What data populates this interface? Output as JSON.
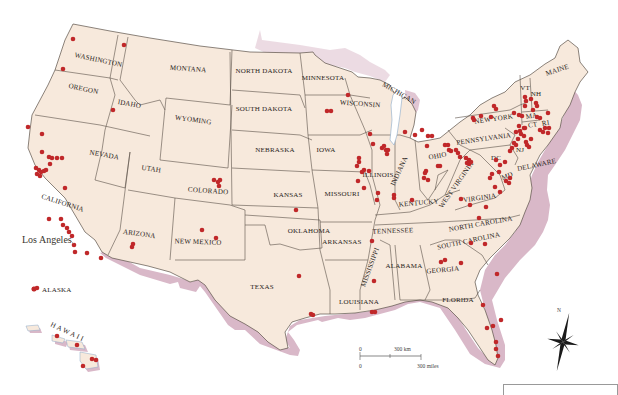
{
  "map": {
    "title": "United States point locations map",
    "background_color": "#ffffff",
    "land_color": "#f7e9dc",
    "border_color": "#5a5048",
    "coast_shadow_color": "#d9b8c8",
    "marker_color": "#c0282a",
    "states": [
      {
        "name": "WASHINGTON",
        "x": 98,
        "y": 62,
        "rot": 12
      },
      {
        "name": "OREGON",
        "x": 83,
        "y": 91,
        "rot": 12
      },
      {
        "name": "IDAHO",
        "x": 129,
        "y": 106,
        "rot": 10
      },
      {
        "name": "MONTANA",
        "x": 188,
        "y": 71,
        "rot": 4
      },
      {
        "name": "WYOMING",
        "x": 193,
        "y": 122,
        "rot": 8
      },
      {
        "name": "NEVADA",
        "x": 104,
        "y": 157,
        "rot": 10
      },
      {
        "name": "UTAH",
        "x": 151,
        "y": 171,
        "rot": 8
      },
      {
        "name": "COLORADO",
        "x": 208,
        "y": 193,
        "rot": 4
      },
      {
        "name": "CALIFORNIA",
        "x": 62,
        "y": 205,
        "rot": 18
      },
      {
        "name": "ARIZONA",
        "x": 139,
        "y": 236,
        "rot": 8
      },
      {
        "name": "NEW MEXICO",
        "x": 198,
        "y": 244,
        "rot": 2
      },
      {
        "name": "NORTH DAKOTA",
        "x": 264,
        "y": 73,
        "rot": 0
      },
      {
        "name": "SOUTH DAKOTA",
        "x": 264,
        "y": 111,
        "rot": 0
      },
      {
        "name": "NEBRASKA",
        "x": 275,
        "y": 152,
        "rot": 0
      },
      {
        "name": "KANSAS",
        "x": 288,
        "y": 197,
        "rot": 0
      },
      {
        "name": "OKLAHOMA",
        "x": 309,
        "y": 233,
        "rot": 0
      },
      {
        "name": "TEXAS",
        "x": 262,
        "y": 289,
        "rot": 0
      },
      {
        "name": "MINNESOTA",
        "x": 323,
        "y": 80,
        "rot": 0
      },
      {
        "name": "IOWA",
        "x": 326,
        "y": 152,
        "rot": 0
      },
      {
        "name": "MISSOURI",
        "x": 342,
        "y": 196,
        "rot": 0
      },
      {
        "name": "ARKANSAS",
        "x": 342,
        "y": 244,
        "rot": 0
      },
      {
        "name": "LOUISIANA",
        "x": 359,
        "y": 304,
        "rot": 0
      },
      {
        "name": "WISCONSIN",
        "x": 360,
        "y": 106,
        "rot": 4
      },
      {
        "name": "MICHIGAN",
        "x": 398,
        "y": 95,
        "rot": 30
      },
      {
        "name": "ILLINOIS",
        "x": 378,
        "y": 177,
        "rot": 0
      },
      {
        "name": "INDIANA",
        "x": 401,
        "y": 172,
        "rot": -65
      },
      {
        "name": "OHIO",
        "x": 438,
        "y": 158,
        "rot": -10
      },
      {
        "name": "KENTUCKY",
        "x": 419,
        "y": 205,
        "rot": -5
      },
      {
        "name": "TENNESSEE",
        "x": 393,
        "y": 233,
        "rot": -2
      },
      {
        "name": "MISSISSIPPI",
        "x": 372,
        "y": 268,
        "rot": -70
      },
      {
        "name": "ALABAMA",
        "x": 404,
        "y": 268,
        "rot": 0
      },
      {
        "name": "GEORGIA",
        "x": 443,
        "y": 272,
        "rot": -5
      },
      {
        "name": "FLORIDA",
        "x": 458,
        "y": 302,
        "rot": 0
      },
      {
        "name": "SOUTH CAROLINA",
        "x": 469,
        "y": 243,
        "rot": -12
      },
      {
        "name": "NORTH CAROLINA",
        "x": 481,
        "y": 226,
        "rot": -10
      },
      {
        "name": "VIRGINIA",
        "x": 480,
        "y": 200,
        "rot": -8
      },
      {
        "name": "WEST VIRGINIA",
        "x": 458,
        "y": 186,
        "rot": -55
      },
      {
        "name": "PENNSYLVANIA",
        "x": 484,
        "y": 141,
        "rot": -8
      },
      {
        "name": "NEW YORK",
        "x": 494,
        "y": 121,
        "rot": -8
      },
      {
        "name": "VT",
        "x": 525,
        "y": 90,
        "rot": 0
      },
      {
        "name": "NH",
        "x": 536,
        "y": 96,
        "rot": 0
      },
      {
        "name": "MAINE",
        "x": 558,
        "y": 72,
        "rot": -18
      },
      {
        "name": "MA",
        "x": 532,
        "y": 118,
        "rot": -10
      },
      {
        "name": "CT",
        "x": 533,
        "y": 127,
        "rot": -10
      },
      {
        "name": "RI",
        "x": 546,
        "y": 125,
        "rot": -10
      },
      {
        "name": "NJ",
        "x": 520,
        "y": 152,
        "rot": 0
      },
      {
        "name": "DC",
        "x": 496,
        "y": 160,
        "rot": 0
      },
      {
        "name": "MD",
        "x": 508,
        "y": 178,
        "rot": -20
      },
      {
        "name": "DELAWARE",
        "x": 537,
        "y": 167,
        "rot": -12
      }
    ],
    "callouts": {
      "los_angeles": "Los Angeles",
      "alaska": "ALASKA",
      "hawaii": "H A W A I I"
    },
    "scale_bar": {
      "km_zero": "0",
      "km_label": "300 km",
      "mi_zero": "0",
      "mi_label": "300 miles"
    },
    "compass": {
      "north_label": "N"
    }
  },
  "markers": [
    [
      73,
      39
    ],
    [
      124,
      45
    ],
    [
      63,
      69
    ],
    [
      113,
      110
    ],
    [
      28,
      127
    ],
    [
      42,
      134
    ],
    [
      42,
      152
    ],
    [
      49,
      157
    ],
    [
      52,
      158
    ],
    [
      57,
      158
    ],
    [
      62,
      158
    ],
    [
      50,
      164
    ],
    [
      36,
      168
    ],
    [
      39,
      170
    ],
    [
      41,
      172
    ],
    [
      44,
      171
    ],
    [
      37,
      174
    ],
    [
      46,
      170
    ],
    [
      40,
      176
    ],
    [
      65,
      188
    ],
    [
      214,
      180
    ],
    [
      220,
      180
    ],
    [
      218,
      182
    ],
    [
      219,
      186
    ],
    [
      49,
      219
    ],
    [
      61,
      219
    ],
    [
      63,
      225
    ],
    [
      67,
      228
    ],
    [
      69,
      232
    ],
    [
      72,
      236
    ],
    [
      74,
      245
    ],
    [
      75,
      252
    ],
    [
      87,
      253
    ],
    [
      101,
      258
    ],
    [
      133,
      244
    ],
    [
      132,
      247
    ],
    [
      202,
      230
    ],
    [
      216,
      238
    ],
    [
      34,
      289
    ],
    [
      37,
      288
    ],
    [
      57,
      336
    ],
    [
      77,
      345
    ],
    [
      92,
      359
    ],
    [
      83,
      366
    ],
    [
      96,
      360
    ],
    [
      296,
      210
    ],
    [
      299,
      276
    ],
    [
      311,
      314
    ],
    [
      313,
      315
    ],
    [
      372,
      241
    ],
    [
      374,
      281
    ],
    [
      372,
      312
    ],
    [
      375,
      312
    ],
    [
      327,
      111
    ],
    [
      331,
      111
    ],
    [
      348,
      95
    ],
    [
      370,
      134
    ],
    [
      373,
      144
    ],
    [
      382,
      148
    ],
    [
      384,
      146
    ],
    [
      386,
      150
    ],
    [
      388,
      150
    ],
    [
      387,
      154
    ],
    [
      359,
      158
    ],
    [
      359,
      162
    ],
    [
      357,
      166
    ],
    [
      364,
      170
    ],
    [
      362,
      172
    ],
    [
      369,
      171
    ],
    [
      358,
      181
    ],
    [
      364,
      188
    ],
    [
      378,
      193
    ],
    [
      377,
      200
    ],
    [
      394,
      195
    ],
    [
      394,
      198
    ],
    [
      412,
      200
    ],
    [
      405,
      132
    ],
    [
      415,
      135
    ],
    [
      422,
      130
    ],
    [
      428,
      136
    ],
    [
      432,
      136
    ],
    [
      427,
      146
    ],
    [
      445,
      145
    ],
    [
      448,
      145
    ],
    [
      449,
      150
    ],
    [
      451,
      151
    ],
    [
      458,
      153
    ],
    [
      456,
      150
    ],
    [
      438,
      166
    ],
    [
      426,
      171
    ],
    [
      425,
      173
    ],
    [
      424,
      178
    ],
    [
      428,
      180
    ],
    [
      460,
      157
    ],
    [
      466,
      158
    ],
    [
      469,
      160
    ],
    [
      467,
      163
    ],
    [
      469,
      164
    ],
    [
      471,
      162
    ],
    [
      440,
      166
    ],
    [
      441,
      262
    ],
    [
      445,
      260
    ],
    [
      461,
      263
    ],
    [
      471,
      243
    ],
    [
      485,
      244
    ],
    [
      479,
      218
    ],
    [
      497,
      274
    ],
    [
      483,
      305
    ],
    [
      501,
      320
    ],
    [
      487,
      328
    ],
    [
      493,
      326
    ],
    [
      496,
      342
    ],
    [
      496,
      349
    ],
    [
      498,
      356
    ],
    [
      461,
      199
    ],
    [
      470,
      205
    ],
    [
      486,
      207
    ],
    [
      496,
      160
    ],
    [
      500,
      165
    ],
    [
      505,
      162
    ],
    [
      499,
      172
    ],
    [
      492,
      174
    ],
    [
      490,
      178
    ],
    [
      506,
      181
    ],
    [
      510,
      178
    ],
    [
      509,
      183
    ],
    [
      495,
      187
    ],
    [
      500,
      192
    ],
    [
      494,
      106
    ],
    [
      496,
      109
    ],
    [
      481,
      116
    ],
    [
      473,
      118
    ],
    [
      474,
      120
    ],
    [
      491,
      117
    ],
    [
      514,
      113
    ],
    [
      519,
      115
    ],
    [
      522,
      116
    ],
    [
      525,
      106
    ],
    [
      526,
      101
    ],
    [
      533,
      110
    ],
    [
      537,
      117
    ],
    [
      540,
      118
    ],
    [
      519,
      126
    ],
    [
      525,
      128
    ],
    [
      520,
      131
    ],
    [
      516,
      132
    ],
    [
      521,
      134
    ],
    [
      524,
      136
    ],
    [
      518,
      139
    ],
    [
      514,
      143
    ],
    [
      516,
      145
    ],
    [
      512,
      148
    ],
    [
      510,
      151
    ],
    [
      524,
      128
    ],
    [
      526,
      142
    ],
    [
      527,
      145
    ],
    [
      529,
      147
    ],
    [
      531,
      139
    ],
    [
      540,
      130
    ],
    [
      545,
      128
    ],
    [
      543,
      132
    ],
    [
      549,
      128
    ],
    [
      548,
      133
    ],
    [
      536,
      103
    ],
    [
      537,
      106
    ],
    [
      531,
      99
    ],
    [
      525,
      97
    ],
    [
      548,
      113
    ]
  ]
}
